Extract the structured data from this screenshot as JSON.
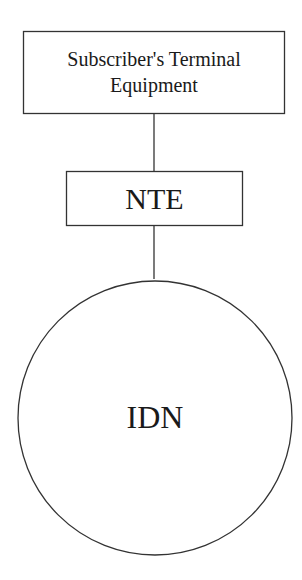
{
  "diagram": {
    "nodes": [
      {
        "id": "terminal",
        "shape": "rectangle",
        "label_line1": "Subscriber's Terminal",
        "label_line2": "Equipment"
      },
      {
        "id": "nte",
        "shape": "rectangle",
        "label": "NTE"
      },
      {
        "id": "idn",
        "shape": "circle",
        "label": "IDN"
      }
    ],
    "edges": [
      {
        "from": "terminal",
        "to": "nte"
      },
      {
        "from": "nte",
        "to": "idn"
      }
    ],
    "colors": {
      "stroke": "#333333",
      "background": "#ffffff"
    }
  }
}
